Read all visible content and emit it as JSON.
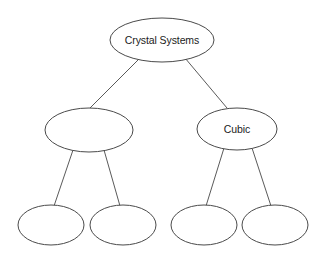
{
  "diagram": {
    "type": "hierarchy-tree",
    "background_color": "#ffffff",
    "node_fill_color": "#ffffff",
    "node_border_color": "#4a4a4a",
    "edge_color": "#5a5a5a",
    "text_color": "#1b1b1b",
    "nodes": [
      {
        "id": "root",
        "label": "Crystal Systems",
        "level": 0,
        "cx": 162,
        "cy": 40,
        "rx": 52,
        "ry": 22
      },
      {
        "id": "mid-left",
        "label": "",
        "level": 1,
        "cx": 89,
        "cy": 130,
        "rx": 44,
        "ry": 22
      },
      {
        "id": "mid-right",
        "label": "Cubic",
        "level": 1,
        "cx": 237,
        "cy": 129,
        "rx": 40,
        "ry": 21
      },
      {
        "id": "leaf-1",
        "label": "",
        "level": 2,
        "cx": 51,
        "cy": 225,
        "rx": 33,
        "ry": 20
      },
      {
        "id": "leaf-2",
        "label": "",
        "level": 2,
        "cx": 123,
        "cy": 225,
        "rx": 33,
        "ry": 20
      },
      {
        "id": "leaf-3",
        "label": "",
        "level": 2,
        "cx": 204,
        "cy": 225,
        "rx": 33,
        "ry": 20
      },
      {
        "id": "leaf-4",
        "label": "",
        "level": 2,
        "cx": 275,
        "cy": 225,
        "rx": 33,
        "ry": 20
      }
    ],
    "edges": [
      {
        "id": "edge-root-midleft",
        "from": "root",
        "to": "mid-left",
        "x1": 140,
        "y1": 58,
        "x2": 90,
        "y2": 108
      },
      {
        "id": "edge-root-midright",
        "from": "root",
        "to": "mid-right",
        "x1": 185,
        "y1": 58,
        "x2": 227,
        "y2": 108
      },
      {
        "id": "edge-midleft-leaf1",
        "from": "mid-left",
        "to": "leaf-1",
        "x1": 73,
        "y1": 150,
        "x2": 54,
        "y2": 206
      },
      {
        "id": "edge-midleft-leaf2",
        "from": "mid-left",
        "to": "leaf-2",
        "x1": 104,
        "y1": 150,
        "x2": 120,
        "y2": 206
      },
      {
        "id": "edge-midright-leaf3",
        "from": "mid-right",
        "to": "leaf-3",
        "x1": 224,
        "y1": 148,
        "x2": 206,
        "y2": 206
      },
      {
        "id": "edge-midright-leaf4",
        "from": "mid-right",
        "to": "leaf-4",
        "x1": 252,
        "y1": 148,
        "x2": 271,
        "y2": 206
      }
    ]
  }
}
